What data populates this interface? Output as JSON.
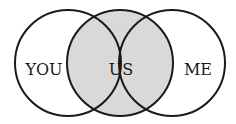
{
  "diagram": {
    "type": "venn",
    "colors": {
      "stroke": "#1a1a1a",
      "background": "#ffffff",
      "shaded": "#d9d9d9"
    },
    "circles": [
      {
        "name": "you",
        "label": "YOU"
      },
      {
        "name": "us",
        "label": "US",
        "shaded": true
      },
      {
        "name": "me",
        "label": "ME"
      }
    ]
  }
}
